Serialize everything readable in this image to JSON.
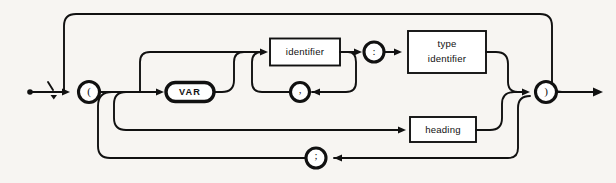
{
  "diagram": {
    "type": "railroad-syntax-diagram",
    "background_color": "#f7f5f2",
    "line_color": "#111111",
    "terminals": [
      {
        "id": "open-paren",
        "glyph": "(",
        "shape": "circle"
      },
      {
        "id": "var-keyword",
        "glyph": "VAR",
        "shape": "oval"
      },
      {
        "id": "comma",
        "glyph": ",",
        "shape": "circle"
      },
      {
        "id": "colon",
        "glyph": ":",
        "shape": "circle"
      },
      {
        "id": "close-paren",
        "glyph": ")",
        "shape": "circle"
      },
      {
        "id": "semicolon",
        "glyph": ";",
        "shape": "circle"
      }
    ],
    "nonterminals": [
      {
        "id": "identifier",
        "label": "identifier",
        "shape": "rect"
      },
      {
        "id": "type-identifier",
        "label_line1": "type",
        "label_line2": "identifier",
        "shape": "rect"
      },
      {
        "id": "heading",
        "label": "heading",
        "shape": "rect"
      }
    ],
    "start_marker": "dot",
    "end_marker": "arrow"
  }
}
